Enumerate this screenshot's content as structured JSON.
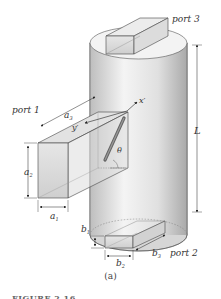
{
  "figure": {
    "panel_label": "(a)",
    "caption_partial": "FIGURE 2.16",
    "ports": {
      "port1": "port 1",
      "port2": "port 2",
      "port3": "port 3"
    },
    "dimensions": {
      "a1": "a",
      "a1_sub": "1",
      "a2": "a",
      "a2_sub": "2",
      "a3": "a",
      "a3_sub": "3",
      "b1": "b",
      "b1_sub": "1",
      "b2": "b",
      "b2_sub": "2",
      "b3": "b",
      "b3_sub": "3",
      "L": "L"
    },
    "axes": {
      "x_prime": "x′",
      "y_prime": "y′",
      "theta": "θ"
    },
    "colors": {
      "cylinder_light": "#f2f2f2",
      "cylinder_dark": "#b8b8b8",
      "box_face": "#d9d9d9",
      "rod": "#777777",
      "line": "#333333"
    }
  }
}
